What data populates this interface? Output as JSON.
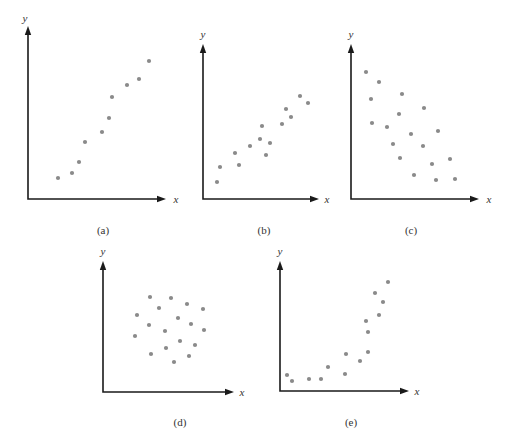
{
  "chart_data": [
    {
      "type": "scatter",
      "panel": "a",
      "caption": "(a)",
      "xlabel": "x",
      "ylabel": "y",
      "grid": false,
      "frame": {
        "origin": [
          28,
          199
        ],
        "x_end": 166,
        "y_top": 26
      },
      "points": [
        [
          58,
          178
        ],
        [
          72,
          173
        ],
        [
          79,
          162
        ],
        [
          85,
          142
        ],
        [
          102,
          132
        ],
        [
          109,
          118
        ],
        [
          112,
          97
        ],
        [
          127,
          85
        ],
        [
          139,
          79
        ],
        [
          149,
          61
        ]
      ]
    },
    {
      "type": "scatter",
      "panel": "b",
      "caption": "(b)",
      "xlabel": "x",
      "ylabel": "y",
      "grid": false,
      "frame": {
        "origin": [
          203,
          199
        ],
        "x_end": 319,
        "y_top": 44
      },
      "points": [
        [
          217,
          182
        ],
        [
          220,
          167
        ],
        [
          235,
          153
        ],
        [
          239,
          165
        ],
        [
          250,
          146
        ],
        [
          260,
          139
        ],
        [
          262,
          126
        ],
        [
          266,
          155
        ],
        [
          270,
          143
        ],
        [
          282,
          124
        ],
        [
          286,
          109
        ],
        [
          291,
          117
        ],
        [
          300,
          96
        ],
        [
          308,
          103
        ]
      ]
    },
    {
      "type": "scatter",
      "panel": "c",
      "caption": "(c)",
      "xlabel": "x",
      "ylabel": "y",
      "grid": false,
      "frame": {
        "origin": [
          351,
          199
        ],
        "x_end": 479,
        "y_top": 44
      },
      "points": [
        [
          366,
          72
        ],
        [
          379,
          82
        ],
        [
          371,
          99
        ],
        [
          402,
          94
        ],
        [
          424,
          108
        ],
        [
          399,
          114
        ],
        [
          372,
          123
        ],
        [
          387,
          127
        ],
        [
          438,
          131
        ],
        [
          411,
          134
        ],
        [
          393,
          144
        ],
        [
          423,
          146
        ],
        [
          400,
          158
        ],
        [
          450,
          159
        ],
        [
          432,
          164
        ],
        [
          414,
          175
        ],
        [
          436,
          180
        ],
        [
          455,
          179
        ]
      ]
    },
    {
      "type": "scatter",
      "panel": "d",
      "caption": "(d)",
      "xlabel": "x",
      "ylabel": "y",
      "grid": false,
      "frame": {
        "origin": [
          103,
          392
        ],
        "x_end": 234,
        "y_top": 261
      },
      "points": [
        [
          150,
          297
        ],
        [
          171,
          298
        ],
        [
          187,
          304
        ],
        [
          159,
          308
        ],
        [
          203,
          309
        ],
        [
          137,
          315
        ],
        [
          178,
          318
        ],
        [
          149,
          325
        ],
        [
          191,
          324
        ],
        [
          165,
          331
        ],
        [
          204,
          330
        ],
        [
          135,
          336
        ],
        [
          180,
          341
        ],
        [
          195,
          345
        ],
        [
          166,
          348
        ],
        [
          151,
          354
        ],
        [
          189,
          356
        ],
        [
          174,
          362
        ]
      ]
    },
    {
      "type": "scatter",
      "panel": "e",
      "caption": "(e)",
      "xlabel": "x",
      "ylabel": "y",
      "grid": false,
      "frame": {
        "origin": [
          280,
          391
        ],
        "x_end": 409,
        "y_top": 261
      },
      "points": [
        [
          287,
          375
        ],
        [
          292,
          381
        ],
        [
          309,
          379
        ],
        [
          321,
          379
        ],
        [
          328,
          367
        ],
        [
          345,
          374
        ],
        [
          346,
          354
        ],
        [
          360,
          361
        ],
        [
          368,
          352
        ],
        [
          366,
          321
        ],
        [
          368,
          332
        ],
        [
          379,
          315
        ],
        [
          375,
          293
        ],
        [
          383,
          302
        ],
        [
          388,
          282
        ]
      ]
    }
  ],
  "panels": {
    "a": {
      "caption": "(a)",
      "xlabel": "x",
      "ylabel": "y"
    },
    "b": {
      "caption": "(b)",
      "xlabel": "x",
      "ylabel": "y"
    },
    "c": {
      "caption": "(c)",
      "xlabel": "x",
      "ylabel": "y"
    },
    "d": {
      "caption": "(d)",
      "xlabel": "x",
      "ylabel": "y"
    },
    "e": {
      "caption": "(e)",
      "xlabel": "x",
      "ylabel": "y"
    }
  },
  "colors": {
    "axis": "#1a1a1a",
    "point": "#8a8a8a",
    "text": "#333333"
  }
}
